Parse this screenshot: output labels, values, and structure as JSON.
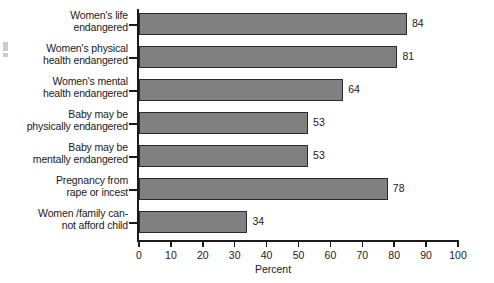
{
  "chart_data": {
    "type": "bar",
    "orientation": "horizontal",
    "title": "",
    "subtitle": "",
    "xlabel": "Percent",
    "ylabel": "",
    "xlim": [
      0,
      100
    ],
    "xticks": [
      0,
      10,
      20,
      30,
      40,
      50,
      60,
      70,
      80,
      90,
      100
    ],
    "xtick_labels": [
      "0",
      "10",
      "20",
      "30",
      "40",
      "50",
      "60",
      "70",
      "80",
      "90",
      "100"
    ],
    "grid": false,
    "legend": false,
    "legend_position": "none",
    "bar_fill_color": "#808080",
    "bar_edge_color": "#2b2b2b",
    "background_color": "#ffffff",
    "axis_color": "#1a1a1a",
    "show_value_labels": true,
    "categories": [
      "Women's life\nendangered",
      "Women's physical\nhealth endangered",
      "Women's mental\nhealth endangered",
      "Baby may be\nphysically endangered",
      "Baby may be\nmentally endangered",
      "Pregnancy from\nrape or incest",
      "Women /family can-\nnot afford child"
    ],
    "values": [
      84,
      81,
      64,
      53,
      53,
      78,
      34
    ],
    "value_labels": [
      "84",
      "81",
      "64",
      "53",
      "53",
      "78",
      "34"
    ]
  }
}
